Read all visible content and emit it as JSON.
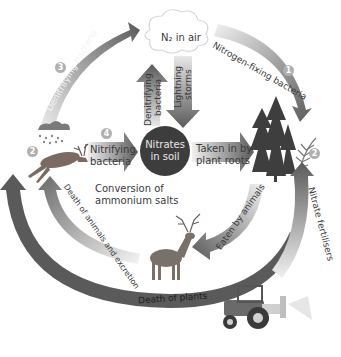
{
  "diagram": {
    "nodes": {
      "air": "N₂ in air",
      "soil_line1": "Nitrates",
      "soil_line2": "in soil",
      "conversion_line1": "Conversion of",
      "conversion_line2": "ammonium salts"
    },
    "arrows": {
      "nitrogen_fixing": "Nitrogen-fixing bacteria",
      "denitrifying_outer": "Denitrifying bacteria",
      "denitrifying_inner_line1": "Denitrifying",
      "denitrifying_inner_line2": "bacteria",
      "lightning_line1": "Lightning",
      "lightning_line2": "storms",
      "nitrifying_line1": "Nitrifying",
      "nitrifying_line2": "bacteria",
      "taken_in_line1": "Taken in by",
      "taken_in_line2": "plant roots",
      "eaten": "Eaten by animals",
      "nitrate_fertilisers": "Nitrate fertilisers",
      "death_animals": "Death of animals and excretion",
      "death_plants": "Death of plants"
    },
    "badges": {
      "one": "1",
      "two_right": "2",
      "two_left": "2",
      "three": "3",
      "four": "4"
    },
    "illustrations": [
      "cloud",
      "rain-cloud",
      "dead-deer",
      "stag",
      "trees",
      "fern",
      "tractor-sprayer"
    ],
    "colors": {
      "arrow_dark": "#5a5a5a",
      "arrow_light": "#d8d8d8",
      "soil_circle": "#3d3d3d",
      "badge": "#b0b0b0",
      "text": "#3a3a3a"
    }
  }
}
